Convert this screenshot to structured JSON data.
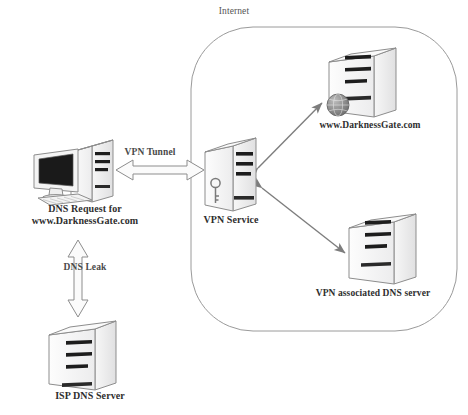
{
  "diagram": {
    "regions": [
      {
        "name": "internet",
        "label": "Internet",
        "shape": "rounded-rectangle"
      }
    ],
    "nodes": [
      {
        "id": "client-pc",
        "label": "DNS Request for\nwww.DarknessGate.com",
        "label_line1": "DNS Request for",
        "label_line2": "www.DarknessGate.com",
        "icon": "desktop-computer-icon"
      },
      {
        "id": "isp-dns-server",
        "label": "ISP DNS Server",
        "icon": "server-tower-icon"
      },
      {
        "id": "vpn-service",
        "label": "VPN Service",
        "icon": "server-tower-key-icon"
      },
      {
        "id": "darknessgate-web-server",
        "label": "www.DarknessGate.com",
        "icon": "server-tower-globe-icon"
      },
      {
        "id": "vpn-associated-dns-server",
        "label": "VPN associated DNS server",
        "icon": "server-tower-icon"
      }
    ],
    "connections": [
      {
        "id": "vpn-tunnel",
        "label": "VPN Tunnel",
        "from": "client-pc",
        "to": "vpn-service",
        "style": "block-arrow",
        "direction": "bidirectional"
      },
      {
        "id": "dns-leak",
        "label": "DNS Leak",
        "from": "client-pc",
        "to": "isp-dns-server",
        "style": "block-arrow",
        "direction": "bidirectional"
      },
      {
        "id": "vpn-to-web",
        "label": "",
        "from": "vpn-service",
        "to": "darknessgate-web-server",
        "style": "line-arrow",
        "direction": "bidirectional"
      },
      {
        "id": "vpn-to-vpn-dns",
        "label": "",
        "from": "vpn-service",
        "to": "vpn-associated-dns-server",
        "style": "line-arrow",
        "direction": "bidirectional"
      }
    ],
    "colors": {
      "background": "#ffffff",
      "stroke": "#8a8a8a",
      "text": "#2e2e2e",
      "muted_text": "#555555",
      "server_face": "#f2f2f2",
      "server_side": "#e2e2e2",
      "server_top": "#fafafa",
      "slot_dark": "#1d1d1d",
      "screen": "#1a1a1a"
    }
  }
}
